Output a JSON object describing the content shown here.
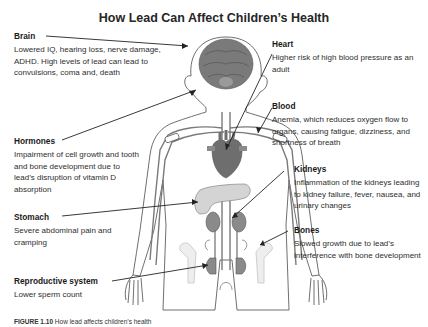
{
  "title": "How Lead Can Affect Children’s Health",
  "sections": {
    "brain": {
      "heading": "Brain",
      "text": "Lowered IQ, hearing loss, nerve damage, ADHD. High levels of lead can lead to convulsions, coma and, death"
    },
    "hormones": {
      "heading": "Hormones",
      "text": "Impairment of cell growth and tooth and bone development due to lead’s disruption of vitamin D absorption"
    },
    "stomach": {
      "heading": "Stomach",
      "text": "Severe abdominal pain and cramping"
    },
    "reproductive": {
      "heading": "Reproductive system",
      "text": "Lower sperm count"
    },
    "heart": {
      "heading": "Heart",
      "text": "Higher risk of high blood pressure as an adult"
    },
    "blood": {
      "heading": "Blood",
      "text": "Anemia, which reduces oxygen flow to organs, causing fatigue, dizziness, and shortness of breath"
    },
    "kidneys": {
      "heading": "Kidneys",
      "text": "Inflammation of the kidneys leading to kidney failure, fever, nausea, and urinary changes"
    },
    "bones": {
      "heading": "Bones",
      "text": "Slowed growth due to lead’s interference with bone development"
    }
  },
  "caption": {
    "label": "FIGURE 1.10",
    "text": "How lead affects children’s health"
  },
  "colors": {
    "organ_dark": "#6e6e6e",
    "organ_mid": "#8a8a8a",
    "organ_light": "#d4d4d4",
    "outline": "#4a4a4a",
    "vessel": "#7a7a7a",
    "text": "#2e2e2e"
  }
}
